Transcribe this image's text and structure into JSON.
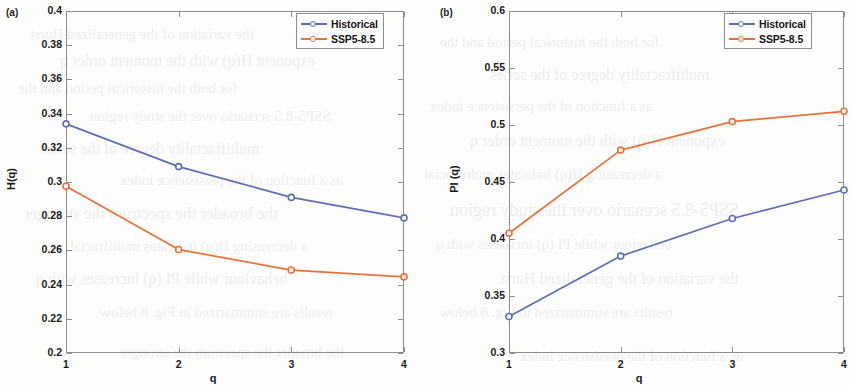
{
  "figure": {
    "panels": [
      {
        "tag": "(a)",
        "xlabel": "q",
        "ylabel": "H(q)"
      },
      {
        "tag": "(b)",
        "xlabel": "q",
        "ylabel": "PI (q)"
      }
    ]
  },
  "colors": {
    "historical": "#5b6fb8",
    "ssp585": "#e8703a",
    "axis": "#8d8d8d",
    "text": "#1a1a1a"
  },
  "chart_data": [
    {
      "type": "line",
      "panel": "(a)",
      "title": "",
      "xlabel": "q",
      "ylabel": "H(q)",
      "x": [
        1,
        2,
        3,
        4
      ],
      "xtick_labels": [
        "1",
        "2",
        "3",
        "4"
      ],
      "ytick_labels": [
        "0.2",
        "0.22",
        "0.24",
        "0.26",
        "0.28",
        "0.3",
        "0.32",
        "0.34",
        "0.36",
        "0.38",
        "0.4"
      ],
      "yticks": [
        0.2,
        0.22,
        0.24,
        0.26,
        0.28,
        0.3,
        0.32,
        0.34,
        0.36,
        0.38,
        0.4
      ],
      "xlim": [
        1,
        4
      ],
      "ylim": [
        0.2,
        0.4
      ],
      "grid": false,
      "legend_position": "top-right",
      "series": [
        {
          "name": "Historical",
          "color": "#5b6fb8",
          "values": [
            0.334,
            0.309,
            0.291,
            0.279
          ]
        },
        {
          "name": "SSP5-8.5",
          "color": "#e8703a",
          "values": [
            0.2975,
            0.2605,
            0.2485,
            0.2445
          ]
        }
      ]
    },
    {
      "type": "line",
      "panel": "(b)",
      "title": "",
      "xlabel": "q",
      "ylabel": "PI (q)",
      "x": [
        1,
        2,
        3,
        4
      ],
      "xtick_labels": [
        "1",
        "2",
        "3",
        "4"
      ],
      "ytick_labels": [
        "0.3",
        "0.35",
        "0.4",
        "0.45",
        "0.5",
        "0.55",
        "0.6"
      ],
      "yticks": [
        0.3,
        0.35,
        0.4,
        0.45,
        0.5,
        0.55,
        0.6
      ],
      "xlim": [
        1,
        4
      ],
      "ylim": [
        0.3,
        0.6
      ],
      "grid": false,
      "legend_position": "top-right",
      "series": [
        {
          "name": "Historical",
          "color": "#5b6fb8",
          "values": [
            0.332,
            0.385,
            0.418,
            0.443
          ]
        },
        {
          "name": "SSP5-8.5",
          "color": "#e8703a",
          "values": [
            0.405,
            0.478,
            0.503,
            0.512
          ]
        }
      ]
    }
  ],
  "legend": {
    "entries": [
      {
        "label": "Historical"
      },
      {
        "label": "SSP5-8.5"
      }
    ]
  },
  "background_text": [
    "the variation of the generalized Hurst",
    "exponent H(q) with the moment order q",
    "for both the historical period and the",
    "SSP5-8.5 scenario over the study region",
    "multifractality degree of the series",
    "as a function of the persistence index",
    "the broader the spectrum the stronger",
    "a decreasing H(q) indicates multifractal",
    "behaviour while PI (q) increases with q",
    "results are summarized in Fig. 8 below"
  ]
}
